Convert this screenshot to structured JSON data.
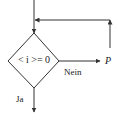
{
  "diagram": {
    "type": "flowchart",
    "decision": {
      "condition": "< i >= 0",
      "condition_display": "< i >= 0"
    },
    "branches": {
      "no_label": "Nein",
      "yes_label": "Ja"
    },
    "target_label": "P",
    "colors": {
      "stroke": "#333333",
      "text": "#222222",
      "background": "#ffffff"
    }
  }
}
